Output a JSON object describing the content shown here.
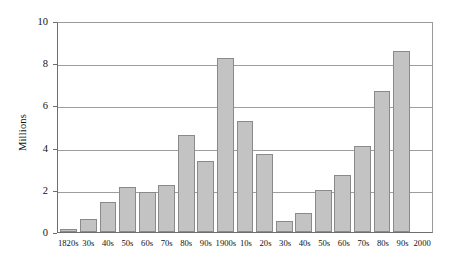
{
  "chart_data": {
    "type": "bar",
    "title": "",
    "subtitle": "",
    "xlabel": "",
    "ylabel": "Millions",
    "ylim": [
      0,
      10
    ],
    "yticks": [
      0,
      2,
      4,
      6,
      8,
      10
    ],
    "ytick_labels": [
      "0",
      "2",
      "4",
      "6",
      "8",
      "10"
    ],
    "grid": "horizontal",
    "legend": "none",
    "bar_color": "#c3c3c3",
    "bar_border_color": "#8a8a8a",
    "gridline_color": "#9d9d9d",
    "axis_color": "#6e6e6e",
    "categories": [
      "1820s",
      "30s",
      "40s",
      "50s",
      "60s",
      "70s",
      "80s",
      "90s",
      "1900s",
      "10s",
      "20s",
      "30s",
      "40s",
      "50s",
      "60s",
      "70s",
      "80s",
      "90s",
      "2000"
    ],
    "values": [
      0.15,
      0.6,
      1.4,
      2.15,
      1.9,
      2.25,
      4.6,
      3.35,
      8.25,
      5.25,
      3.7,
      0.5,
      0.9,
      2.0,
      2.7,
      4.1,
      6.7,
      8.6,
      0
    ],
    "series": [
      {
        "name": "Millions",
        "values": [
          0.15,
          0.6,
          1.4,
          2.15,
          1.9,
          2.25,
          4.6,
          3.35,
          8.25,
          5.25,
          3.7,
          0.5,
          0.9,
          2.0,
          2.7,
          4.1,
          6.7,
          8.6,
          0
        ]
      }
    ]
  }
}
